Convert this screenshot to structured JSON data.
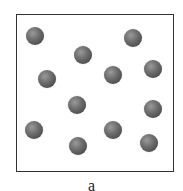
{
  "figure": {
    "label": "a",
    "particle_color": "#5a5a5a",
    "border_color": "#333333",
    "particles": [
      {
        "x": 35,
        "y": 36
      },
      {
        "x": 133,
        "y": 38
      },
      {
        "x": 83,
        "y": 55
      },
      {
        "x": 47,
        "y": 79
      },
      {
        "x": 113,
        "y": 75
      },
      {
        "x": 153,
        "y": 69
      },
      {
        "x": 77,
        "y": 105
      },
      {
        "x": 153,
        "y": 109
      },
      {
        "x": 34,
        "y": 130
      },
      {
        "x": 113,
        "y": 130
      },
      {
        "x": 78,
        "y": 146
      },
      {
        "x": 149,
        "y": 143
      }
    ]
  }
}
